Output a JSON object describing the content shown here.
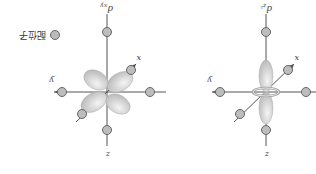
{
  "figure": {
    "orientation_deg": 180,
    "legend": {
      "label": "配位子",
      "marker": "ligand-circle"
    },
    "panels": [
      {
        "orbital": "d",
        "subscript": "xy",
        "axes": [
          "x",
          "y",
          "z"
        ]
      },
      {
        "orbital": "d",
        "subscript": "z²",
        "axes": [
          "x",
          "y",
          "z"
        ]
      }
    ],
    "colors": {
      "lobe": "#d9d9d9",
      "ligand": "#bdbdbd",
      "axis": "#555555"
    }
  }
}
